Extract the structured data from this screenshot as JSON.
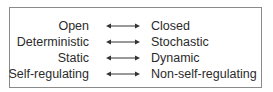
{
  "diagram": {
    "rows": [
      {
        "left": "Open",
        "right": "Closed",
        "relation": "double-arrow"
      },
      {
        "left": "Deterministic",
        "right": "Stochastic",
        "relation": "double-arrow"
      },
      {
        "left": "Static",
        "right": "Dynamic",
        "relation": "double-arrow"
      },
      {
        "left": "Self-regulating",
        "right": "Non-self-regulating",
        "relation": "double-arrow"
      }
    ]
  }
}
